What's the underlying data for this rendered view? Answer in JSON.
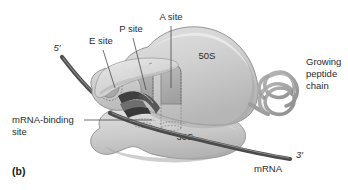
{
  "figure": {
    "panel_letter": "(b)",
    "title_alt": "Ribosome structure showing 50S and 30S subunits with A, P, and E sites",
    "background_color": "#ffffff"
  },
  "labels": {
    "a_site": "A site",
    "p_site": "P site",
    "e_site": "E site",
    "large_subunit": "50S",
    "small_subunit": "30S",
    "mrna_binding_site_line1": "mRNA-binding",
    "mrna_binding_site_line2": "site",
    "growing_peptide_line1": "Growing",
    "growing_peptide_line2": "peptide",
    "growing_peptide_line3": "chain",
    "five_prime": "5′",
    "three_prime": "3′",
    "mrna": "mRNA"
  },
  "colors": {
    "subunit_large_fill": "#cfcfcf",
    "subunit_large_light": "#dedede",
    "subunit_small_fill": "#c8c8c8",
    "subunit_small_light": "#dcdcdc",
    "site_pocket_fill": "#b0b0b0",
    "trna_dark": "#3d3d3d",
    "trna_mid": "#6b6b6b",
    "mrna_strand": "#4a4a4a",
    "peptide_chain": "#9a9a9a",
    "outline_stroke": "#8a8a8a",
    "text_color": "#2b2b2b",
    "leader_line": "#4a4a4a"
  }
}
